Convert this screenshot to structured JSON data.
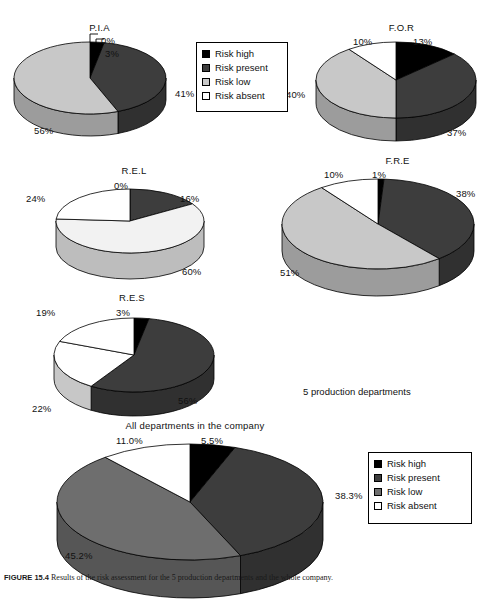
{
  "figure": {
    "caption_label": "FIGURE 15.4",
    "caption_text": "Results of the risk assessment for the 5 production departments and the whole company.",
    "note": "5 production departments"
  },
  "legend_top": {
    "items": [
      {
        "label": "Risk high",
        "color": "#000000"
      },
      {
        "label": "Risk present",
        "color": "#3d3d3d"
      },
      {
        "label": "Risk low",
        "color": "#c8c8c8"
      },
      {
        "label": "Risk absent",
        "color": "#ffffff"
      }
    ]
  },
  "legend_bottom": {
    "items": [
      {
        "label": "Risk high",
        "color": "#000000"
      },
      {
        "label": "Risk present",
        "color": "#3d3d3d"
      },
      {
        "label": "Risk low",
        "color": "#6e6e6e"
      },
      {
        "label": "Risk absent",
        "color": "#ffffff"
      }
    ]
  },
  "chart_data": [
    {
      "type": "pie",
      "title": "P.I.A",
      "categories": [
        "Risk high",
        "Risk present",
        "Risk low",
        "Risk absent"
      ],
      "values": [
        3,
        41,
        56,
        0
      ],
      "labels": [
        "3%",
        "41%",
        "56%",
        "0%"
      ],
      "colors": [
        "#000000",
        "#3d3d3d",
        "#c8c8c8",
        "#ffffff"
      ],
      "units": "percent"
    },
    {
      "type": "pie",
      "title": "F.O.R",
      "categories": [
        "Risk high",
        "Risk present",
        "Risk low",
        "Risk absent"
      ],
      "values": [
        13,
        37,
        40,
        10
      ],
      "labels": [
        "13%",
        "37%",
        "40%",
        "10%"
      ],
      "colors": [
        "#000000",
        "#3d3d3d",
        "#c8c8c8",
        "#ffffff"
      ],
      "units": "percent"
    },
    {
      "type": "pie",
      "title": "R.E.L",
      "categories": [
        "Risk high",
        "Risk present",
        "Risk low",
        "Risk absent"
      ],
      "values": [
        0,
        16,
        60,
        24
      ],
      "labels": [
        "0%",
        "16%",
        "60%",
        "24%"
      ],
      "colors": [
        "#000000",
        "#3d3d3d",
        "#f2f2f2",
        "#ffffff"
      ],
      "units": "percent"
    },
    {
      "type": "pie",
      "title": "F.R.E",
      "categories": [
        "Risk high",
        "Risk present",
        "Risk low",
        "Risk absent"
      ],
      "values": [
        1,
        38,
        51,
        10
      ],
      "labels": [
        "1%",
        "38%",
        "51%",
        "10%"
      ],
      "colors": [
        "#000000",
        "#3d3d3d",
        "#c8c8c8",
        "#ffffff"
      ],
      "units": "percent"
    },
    {
      "type": "pie",
      "title": "R.E.S",
      "categories": [
        "Risk high",
        "Risk present",
        "Risk low",
        "Risk absent"
      ],
      "values": [
        3,
        56,
        22,
        19
      ],
      "labels": [
        "3%",
        "56%",
        "22%",
        "19%"
      ],
      "colors": [
        "#000000",
        "#3d3d3d",
        "#ffffff",
        "#ffffff"
      ],
      "units": "percent"
    },
    {
      "type": "pie",
      "title": "All departments in the company",
      "categories": [
        "Risk high",
        "Risk present",
        "Risk low",
        "Risk absent"
      ],
      "values": [
        5.5,
        38.3,
        45.2,
        11.0
      ],
      "labels": [
        "5.5%",
        "38.3%",
        "45.2%",
        "11.0%"
      ],
      "colors": [
        "#000000",
        "#3d3d3d",
        "#6e6e6e",
        "#ffffff"
      ],
      "units": "percent"
    }
  ]
}
